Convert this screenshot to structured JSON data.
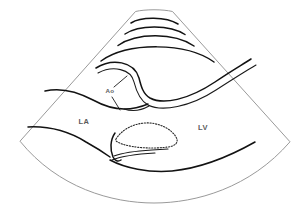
{
  "figure": {
    "kind": "echocardiogram-sector-line-drawing",
    "title": "",
    "background_color": "#ffffff"
  },
  "colors": {
    "sector_border": "#9a9a9a",
    "anatomy_stroke": "#121212",
    "valve_stroke": "#2a2a2a",
    "label_text": "#5b5b5b"
  },
  "sector": {
    "name": "ultrasound-scan-sector",
    "apex_top_left": "135,11",
    "apex_top_right": "173,11",
    "bottom_left": "20,141",
    "bottom_right": "290,142",
    "bottom_arc_depth_y": "196"
  },
  "labels": [
    {
      "id": "la",
      "text": "LA",
      "x": 84,
      "y": 124,
      "meaning": "left-atrium"
    },
    {
      "id": "lv",
      "text": "LV",
      "x": 203,
      "y": 130,
      "meaning": "left-ventricle"
    },
    {
      "id": "ao",
      "text": "Ao",
      "x": 110,
      "y": 93,
      "meaning": "aorta"
    }
  ],
  "structures": [
    {
      "id": "near-field-arc-1",
      "description": "outermost near-field tissue arc"
    },
    {
      "id": "near-field-arc-2",
      "description": "second near-field tissue arc"
    },
    {
      "id": "near-field-arc-3",
      "description": "third near-field tissue arc"
    },
    {
      "id": "chest-wall-arc",
      "description": "chest wall / right ventricular free wall arc"
    },
    {
      "id": "aortic-root-anterior",
      "description": "anterior aortic root wall"
    },
    {
      "id": "aortic-root-posterior",
      "description": "posterior aortic root wall continuing to LA roof"
    },
    {
      "id": "la-posterior-wall",
      "description": "left atrium posterior wall"
    },
    {
      "id": "mitral-leaflet-dotted",
      "description": "mitral valve leaflet outline, dotted"
    },
    {
      "id": "interventricular-septum",
      "description": "septum / LV inferolateral wall"
    },
    {
      "id": "lv-posterior-wall",
      "description": "left ventricular posterior wall"
    }
  ]
}
